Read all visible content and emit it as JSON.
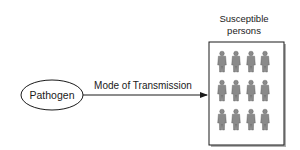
{
  "diagram": {
    "source_node": {
      "label": "Pathogen"
    },
    "edge": {
      "label": "Mode of Transmission"
    },
    "target_node": {
      "title_line1": "Susceptible",
      "title_line2": "persons",
      "rows": 3,
      "cols": 4,
      "figure_icon": "person-icon"
    }
  },
  "colors": {
    "stroke": "#1a1a1a",
    "figure_fill": "#8a8a8a",
    "shadow": "#b0b0b0"
  }
}
